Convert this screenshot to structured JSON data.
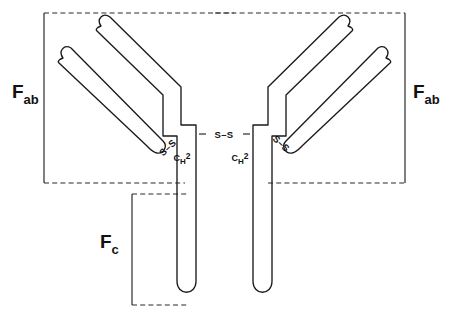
{
  "figure": {
    "background_color": "#ffffff",
    "stroke_color": "#1a1a1a",
    "bracket_color": "#2b2b2b"
  },
  "regions": {
    "fab_left": {
      "label_main": "F",
      "label_sub": "ab",
      "name": "Fab region (left arm)"
    },
    "fab_right": {
      "label_main": "F",
      "label_sub": "ab",
      "name": "Fab region (right arm)"
    },
    "fc": {
      "label_main": "F",
      "label_sub": "c",
      "name": "Fc region (stem)"
    }
  },
  "domains": {
    "ch2_left": {
      "label_c": "C",
      "label_h": "H",
      "label_num": "2"
    },
    "ch2_right": {
      "label_c": "C",
      "label_h": "H",
      "label_num": "2"
    }
  },
  "disulfide_bonds": {
    "hinge_center": {
      "label": "S–S",
      "name": "Inter-heavy-chain disulfide bond"
    },
    "light_heavy_left": {
      "label": "S–S",
      "name": "Light–heavy chain disulfide bond (left)"
    },
    "light_heavy_right": {
      "label": "S–S",
      "name": "Light–heavy chain disulfide bond (right)"
    }
  },
  "chains": {
    "heavy_left": {
      "name": "Heavy chain (left)"
    },
    "heavy_right": {
      "name": "Heavy chain (right)"
    },
    "light_left": {
      "name": "Light chain (left)"
    },
    "light_right": {
      "name": "Light chain (right)"
    }
  }
}
